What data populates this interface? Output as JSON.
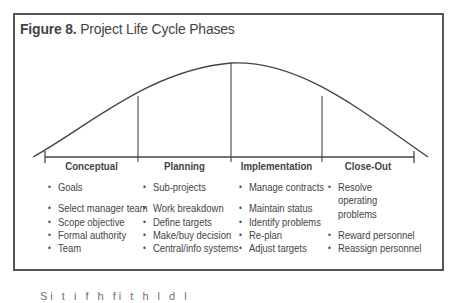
{
  "figure": {
    "number_label": "Figure 8.",
    "title": "Project Life Cycle Phases"
  },
  "phases": [
    {
      "label": "Conceptual",
      "items_top": [
        "Goals"
      ],
      "items": [
        "Select manager team",
        "Scope objective",
        "Formal authority",
        "Team"
      ]
    },
    {
      "label": "Planning",
      "items_top": [
        "Sub-projects"
      ],
      "items": [
        "Work breakdown",
        "Define targets",
        "Make/buy decision",
        "Central/info systems"
      ]
    },
    {
      "label": "Implementation",
      "items_top": [
        "Manage contracts"
      ],
      "items": [
        "Maintain status",
        "Identify problems",
        "Re-plan",
        "Adjust targets"
      ]
    },
    {
      "label": "Close-Out",
      "items_top": [
        "Resolve operating problems"
      ],
      "items": [
        "Reward personnel",
        "Reassign personnel"
      ]
    }
  ],
  "colors": {
    "line": "#444444",
    "frame": "#555555",
    "text": "#444444"
  },
  "footer": {
    "partial_text": "Si                                   t i   f   h  fi                    t h  l d    l   "
  }
}
